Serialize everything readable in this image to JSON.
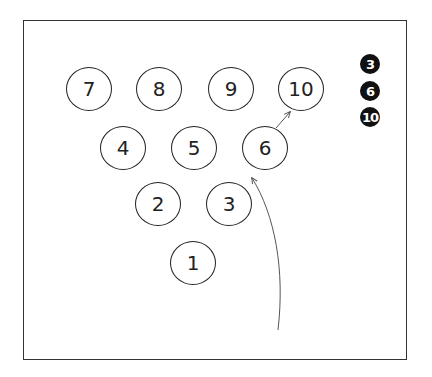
{
  "diagram": {
    "type": "bowling-pin-spare-diagram",
    "pins": [
      {
        "label": "7",
        "x": 90,
        "y": 90
      },
      {
        "label": "8",
        "x": 160,
        "y": 90
      },
      {
        "label": "9",
        "x": 232,
        "y": 90
      },
      {
        "label": "10",
        "x": 302,
        "y": 90
      },
      {
        "label": "4",
        "x": 124,
        "y": 149
      },
      {
        "label": "5",
        "x": 195,
        "y": 149
      },
      {
        "label": "6",
        "x": 266,
        "y": 149
      },
      {
        "label": "2",
        "x": 159,
        "y": 205
      },
      {
        "label": "3",
        "x": 230,
        "y": 205
      },
      {
        "label": "1",
        "x": 194,
        "y": 264
      }
    ],
    "remaining_pins": [
      {
        "label": "3",
        "x": 370,
        "y": 64
      },
      {
        "label": "6",
        "x": 370,
        "y": 91
      },
      {
        "label": "10",
        "x": 370,
        "y": 117
      }
    ],
    "arrows": [
      {
        "name": "ball-path",
        "path": "M278,330 C285,270 275,215 252,178"
      },
      {
        "name": "pin-deflection",
        "path": "M276,128 L290,112"
      }
    ],
    "colors": {
      "stroke": "#222222",
      "filled": "#111111",
      "arrow": "#555555"
    }
  }
}
